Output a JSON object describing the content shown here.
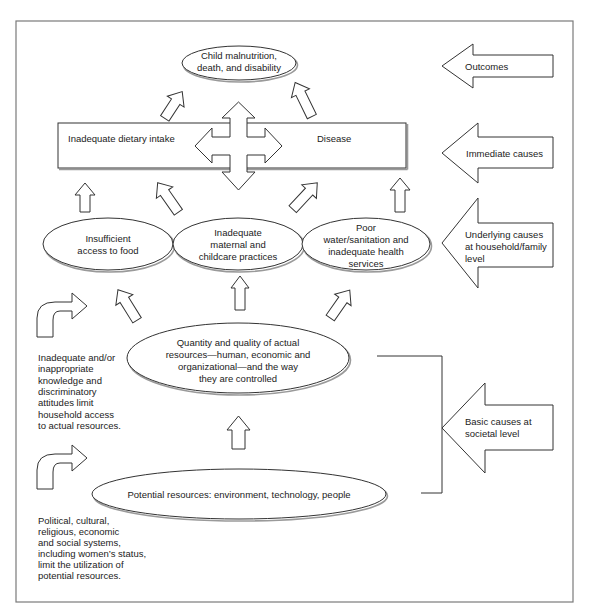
{
  "figure": {
    "outcome_node": {
      "lines": [
        "Child malnutrition,",
        "death, and disability"
      ]
    },
    "immediate_box": {
      "left_label": "Inadequate dietary intake",
      "right_label": "Disease"
    },
    "underlying_nodes": [
      {
        "lines": [
          "Insufficient",
          "access to food"
        ]
      },
      {
        "lines": [
          "Inadequate",
          "maternal and",
          "childcare practices"
        ]
      },
      {
        "lines": [
          "Poor",
          "water/sanitation  and",
          "inadequate health",
          "services"
        ]
      }
    ],
    "actual_resources_node": {
      "lines": [
        "Quantity and quality of actual",
        "resources—human, economic  and",
        "organizational—and the way",
        "they are controlled"
      ]
    },
    "potential_resources_node": {
      "label": "Potential resources: environment, technology, people"
    },
    "side_notes": [
      {
        "lines": [
          "Inadequate and/or",
          "inappropriate",
          "knowledge and",
          "discriminatory",
          "attitudes limit",
          "household access",
          "to actual resources."
        ]
      },
      {
        "lines": [
          "Political, cultural,",
          "religious, economic",
          "and social systems,",
          "including women’s status,",
          "limit the utilization of",
          "potential resources."
        ]
      }
    ]
  },
  "levels": [
    {
      "lines": [
        "Outcomes"
      ]
    },
    {
      "lines": [
        "Immediate causes"
      ]
    },
    {
      "lines": [
        "Underlying causes",
        "at household/family",
        "level"
      ]
    },
    {
      "lines": [
        "Basic causes at",
        "societal level"
      ]
    }
  ],
  "colors": {
    "line": "#333333",
    "text": "#222222",
    "frame": "#7a7a7a",
    "shadow": "#9a9a9a"
  }
}
